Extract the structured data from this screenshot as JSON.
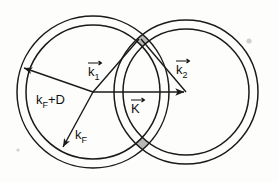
{
  "figure": {
    "background_color": "#fdfdfc",
    "line_color": "#1a1a1a",
    "shade_color": "#a8a8a8",
    "labels": {
      "k1": {
        "base": "k",
        "sub": "1",
        "accent": "vector-arrow"
      },
      "k2": {
        "base": "k",
        "sub": "2",
        "accent": "vector-arrow"
      },
      "K": {
        "base": "K",
        "sub": "",
        "accent": "vector-arrow"
      },
      "kF": {
        "base": "k",
        "sub": "F",
        "accent": "none"
      },
      "kFD": {
        "base": "k",
        "sub": "F",
        "suffix": "+D",
        "accent": "none"
      }
    },
    "geometry": {
      "left_center": {
        "x": 93,
        "y": 92
      },
      "right_center": {
        "x": 186,
        "y": 92
      },
      "left_outer_radius": 76,
      "left_inner_radius": 67,
      "right_outer_radius": 72,
      "right_inner_radius": 63,
      "top_intersection": {
        "x": 140,
        "y": 38
      },
      "bottom_intersection": {
        "x": 140,
        "y": 146
      }
    },
    "vectors": [
      {
        "name": "k1",
        "from": {
          "x": 93,
          "y": 92
        },
        "to": {
          "x": 140,
          "y": 38
        }
      },
      {
        "name": "k2",
        "from": {
          "x": 186,
          "y": 92
        },
        "to": {
          "x": 140,
          "y": 38
        }
      },
      {
        "name": "K",
        "from": {
          "x": 93,
          "y": 92
        },
        "to": {
          "x": 186,
          "y": 92
        }
      },
      {
        "name": "kF",
        "from": {
          "x": 93,
          "y": 92
        },
        "to": {
          "x": 62,
          "y": 148
        }
      },
      {
        "name": "kFD",
        "from": {
          "x": 93,
          "y": 92
        },
        "to": {
          "x": 22,
          "y": 67
        }
      }
    ]
  }
}
